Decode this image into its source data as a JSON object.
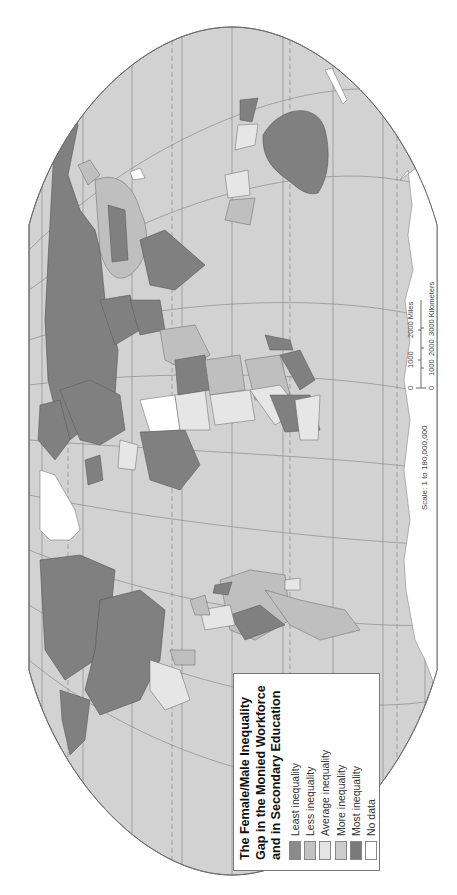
{
  "legend": {
    "title_lines": [
      "The Female/Male Inequality",
      "Gap in the Monied Workforce",
      "and in Secondary Education"
    ],
    "items": [
      {
        "label": "Least inequality",
        "color": "#8a8a8a"
      },
      {
        "label": "Less inequality",
        "color": "#c2c2c2"
      },
      {
        "label": "Average inequality",
        "color": "#e4e4e4"
      },
      {
        "label": "More inequality",
        "color": "#cccccc"
      },
      {
        "label": "Most inequality",
        "color": "#7a7a7a"
      },
      {
        "label": "No data",
        "color": "#ffffff"
      }
    ]
  },
  "scale": {
    "ratio_label": "Scale: 1 to 180,000,000",
    "miles_ticks": [
      "0",
      "1000",
      "2000 Miles"
    ],
    "km_ticks": [
      "0",
      "1000",
      "2000",
      "3000 Kilometers"
    ]
  },
  "colors": {
    "ocean": "#d2d2d2",
    "land_dark": "#808080",
    "land_mid": "#bfbfbf",
    "land_light": "#e6e6e6",
    "no_data": "#ffffff",
    "graticule": "#8c8c8c",
    "outline": "#6e6e6e"
  },
  "orientation": "rotated 90 degrees counter-clockwise"
}
